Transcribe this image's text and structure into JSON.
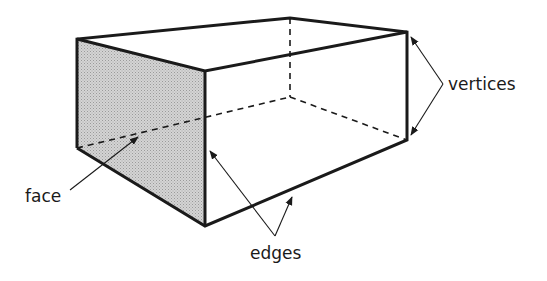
{
  "diagram": {
    "labels": {
      "face": "face",
      "edges": "edges",
      "vertices": "vertices"
    },
    "colors": {
      "stroke": "#1a1a1a",
      "shaded_face": "#c9c9c9",
      "background": "#ffffff"
    }
  }
}
